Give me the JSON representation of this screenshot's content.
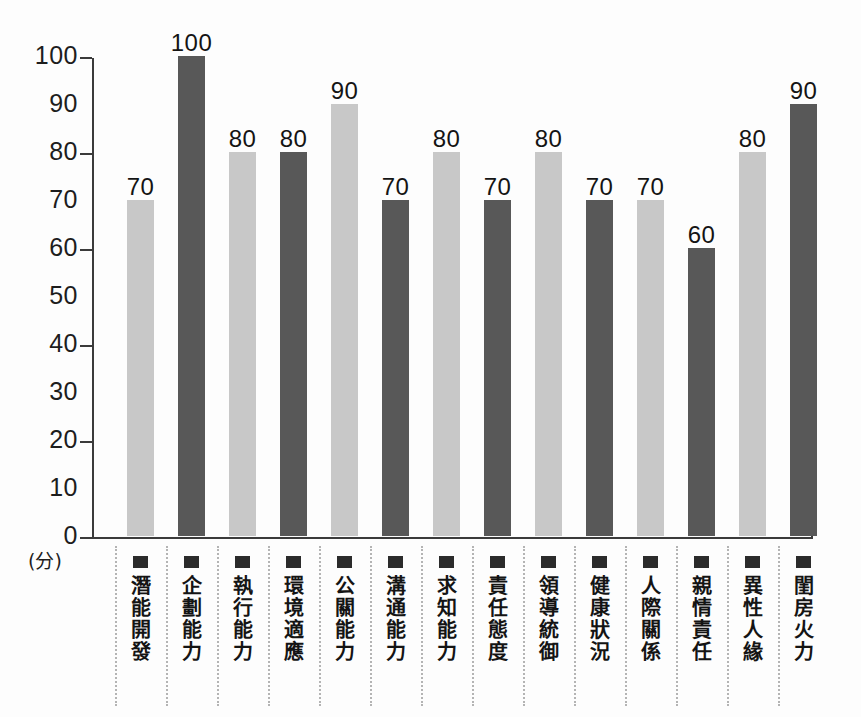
{
  "chart_data": {
    "type": "bar",
    "title": "",
    "subtitle": "",
    "xlabel": "",
    "ylabel": "(分)",
    "ylim": [
      0,
      100
    ],
    "ytick_labels": [
      "0",
      "10",
      "20",
      "30",
      "40",
      "50",
      "60",
      "70",
      "80",
      "90",
      "100"
    ],
    "ytick_values": [
      0,
      10,
      20,
      30,
      40,
      50,
      60,
      70,
      80,
      90,
      100
    ],
    "major_tick_values": [
      0,
      20,
      40,
      60,
      80,
      100
    ],
    "grid": false,
    "legend": "none",
    "categories": [
      "潛能開發",
      "企劃能力",
      "執行能力",
      "環境適應",
      "公關能力",
      "溝通能力",
      "求知能力",
      "責任態度",
      "領導統御",
      "健康狀況",
      "人際關係",
      "親情責任",
      "異性人緣",
      "閨房火力"
    ],
    "values": [
      70,
      100,
      80,
      80,
      90,
      70,
      80,
      70,
      80,
      70,
      70,
      60,
      80,
      90
    ],
    "bar_colors": [
      "#c8c8c8",
      "#585858",
      "#c8c8c8",
      "#585858",
      "#c8c8c8",
      "#585858",
      "#c8c8c8",
      "#585858",
      "#c8c8c8",
      "#585858",
      "#c8c8c8",
      "#585858",
      "#c8c8c8",
      "#585858"
    ],
    "data_labels": [
      "70",
      "100",
      "80",
      "80",
      "90",
      "70",
      "80",
      "70",
      "80",
      "70",
      "70",
      "60",
      "80",
      "90"
    ],
    "axis_color": "#3b3b3b",
    "background_color": "#fdfdfd",
    "marker_color": "#2b2b2b",
    "separator_color": "#b4b4b4"
  }
}
